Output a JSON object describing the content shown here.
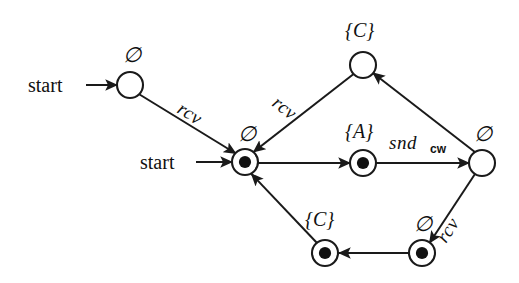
{
  "diagram": {
    "background_color": "#ffffff",
    "stroke_color": "#1a1a1a",
    "labels": {
      "start_upper": "start",
      "start_lower": "start",
      "empty_set": "∅",
      "set_c": "{C}",
      "set_a": "{A}",
      "rcv": "rcv",
      "snd": "snd",
      "snd_subscript": "cw"
    },
    "nodes": [
      {
        "id": "n-init-upper",
        "name": "initial-state-upper",
        "label": "∅",
        "kind": "plain",
        "cx": 130,
        "cy": 85,
        "r": 13
      },
      {
        "id": "n-top-c",
        "name": "state-top-c",
        "label": "{C}",
        "kind": "plain",
        "cx": 363,
        "cy": 65,
        "r": 13
      },
      {
        "id": "n-center",
        "name": "initial-accepting-center",
        "label": "∅",
        "kind": "accepting",
        "cx": 245,
        "cy": 162,
        "r": 13
      },
      {
        "id": "n-mid-a",
        "name": "state-mid-a",
        "label": "{A}",
        "kind": "accepting",
        "cx": 363,
        "cy": 163,
        "r": 13
      },
      {
        "id": "n-right",
        "name": "state-right",
        "label": "∅",
        "kind": "plain",
        "cx": 482,
        "cy": 163,
        "r": 13
      },
      {
        "id": "n-bot-c",
        "name": "state-bottom-c",
        "label": "{C}",
        "kind": "accepting",
        "cx": 325,
        "cy": 253,
        "r": 13
      },
      {
        "id": "n-bot-right",
        "name": "state-bottom-right",
        "label": "∅",
        "kind": "accepting",
        "cx": 422,
        "cy": 253,
        "r": 13
      }
    ],
    "edges": [
      {
        "name": "edge-start-to-init-upper",
        "from": "start-marker-upper",
        "to": "n-init-upper",
        "label": ""
      },
      {
        "name": "edge-init-upper-to-center",
        "from": "n-init-upper",
        "to": "n-center",
        "label": "rcv"
      },
      {
        "name": "edge-start-to-center",
        "from": "start-marker-lower",
        "to": "n-center",
        "label": ""
      },
      {
        "name": "edge-top-c-to-center",
        "from": "n-top-c",
        "to": "n-center",
        "label": "rcv"
      },
      {
        "name": "edge-center-to-mid-a",
        "from": "n-center",
        "to": "n-mid-a",
        "label": ""
      },
      {
        "name": "edge-mid-a-to-right",
        "from": "n-mid-a",
        "to": "n-right",
        "label": "snd_cw"
      },
      {
        "name": "edge-right-to-top-c",
        "from": "n-right",
        "to": "n-top-c",
        "label": ""
      },
      {
        "name": "edge-right-to-bot-right",
        "from": "n-right",
        "to": "n-bot-right",
        "label": "rcv"
      },
      {
        "name": "edge-bot-right-to-bot-c",
        "from": "n-bot-right",
        "to": "n-bot-c",
        "label": ""
      },
      {
        "name": "edge-bot-c-to-center",
        "from": "n-bot-c",
        "to": "n-center",
        "label": ""
      }
    ]
  }
}
